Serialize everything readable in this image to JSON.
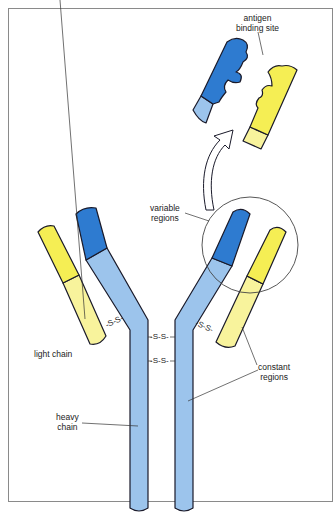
{
  "diagram": {
    "labels": {
      "antigen_binding_site": [
        "antigen",
        "binding site"
      ],
      "variable_regions": [
        "variable",
        "regions"
      ],
      "light_chain": "light chain",
      "heavy_chain": [
        "heavy",
        "chain"
      ],
      "constant_regions": [
        "constant",
        "regions"
      ]
    },
    "disulfide_bonds": [
      "-S-S-",
      "-S-S-",
      "-S-S-",
      "-S-S-"
    ],
    "colors": {
      "heavy_variable": "#2e7bd0",
      "heavy_constant": "#9cc4ec",
      "light_variable": "#f5ee54",
      "light_constant": "#f8f39c",
      "outline": "#1a1a2a",
      "frame": "#8a8a8a"
    }
  }
}
